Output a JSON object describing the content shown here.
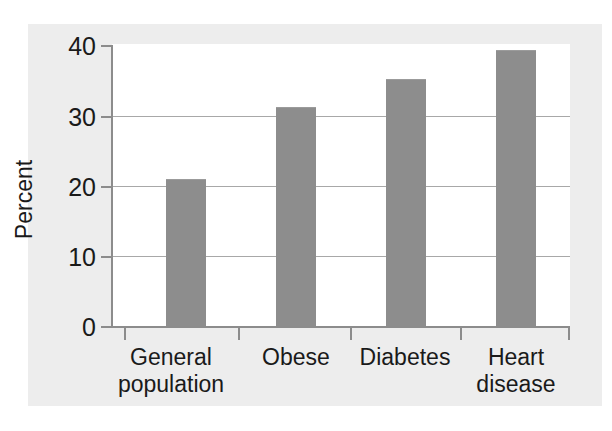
{
  "chart_data": {
    "type": "bar",
    "title": "",
    "subtitle": "",
    "xlabel": "",
    "ylabel": "Percent",
    "categories": [
      "General\npopulation",
      "Obese",
      "Diabetes",
      "Heart\ndisease"
    ],
    "categories_flat": [
      "General population",
      "Obese",
      "Diabetes",
      "Heart disease"
    ],
    "values": [
      21,
      31.3,
      35.3,
      39.4
    ],
    "ylim": [
      0,
      40
    ],
    "yticks": [
      0,
      10,
      20,
      30,
      40
    ],
    "ytick_labels": [
      "0",
      "10",
      "20",
      "30",
      "40"
    ],
    "grid": "horizontal",
    "legend": "none",
    "series": [
      {
        "name": "Percent",
        "values": [
          21,
          31.3,
          35.3,
          39.4
        ]
      }
    ],
    "annotations": []
  },
  "colors": {
    "bar_fill": "#8d8d8d",
    "axis": "#8c8c8c",
    "gridline": "#a8a8a8",
    "text": "#1a1a1a",
    "plot_background": "#ffffff",
    "page_background": "#ededed",
    "canvas_background": "#ffffff"
  },
  "axes": {
    "y_title": "Percent",
    "y_tick_0": "0",
    "y_tick_1": "10",
    "y_tick_2": "20",
    "y_tick_3": "30",
    "y_tick_4": "40"
  },
  "bars": [
    {
      "label": "General\npopulation",
      "value": 21
    },
    {
      "label": "Obese",
      "value": 31.3
    },
    {
      "label": "Diabetes",
      "value": 35.3
    },
    {
      "label": "Heart\ndisease",
      "value": 39.4
    }
  ]
}
